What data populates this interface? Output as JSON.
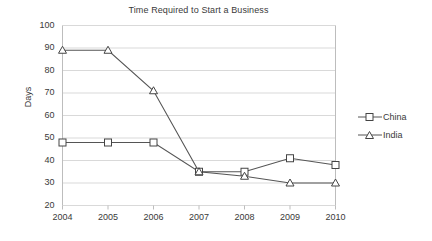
{
  "chart_data": {
    "type": "line",
    "title": "Time Required to Start a Business",
    "xlabel": "",
    "ylabel": "Days",
    "x": [
      "2004",
      "2005",
      "2006",
      "2007",
      "2008",
      "2009",
      "2010"
    ],
    "categories": [
      "2004",
      "2005",
      "2006",
      "2007",
      "2008",
      "2009",
      "2010"
    ],
    "series": [
      {
        "name": "China",
        "marker": "square",
        "values": [
          48,
          48,
          48,
          35,
          35,
          41,
          38
        ]
      },
      {
        "name": "India",
        "marker": "triangle",
        "values": [
          89,
          89,
          71,
          35,
          33,
          30,
          30
        ]
      }
    ],
    "ylim": [
      20,
      100
    ],
    "y_ticks": [
      20,
      30,
      40,
      50,
      60,
      70,
      80,
      90,
      100
    ],
    "grid": true,
    "legend_position": "right",
    "colors": {
      "line": "#555555",
      "marker_fill": "#ffffff",
      "marker_stroke": "#444444",
      "grid": "#d9d9d9",
      "axis": "#bdbdbd",
      "text": "#3a3a3a",
      "background": "#ffffff"
    }
  },
  "legend": {
    "items": [
      {
        "label": "China"
      },
      {
        "label": "India"
      }
    ]
  }
}
